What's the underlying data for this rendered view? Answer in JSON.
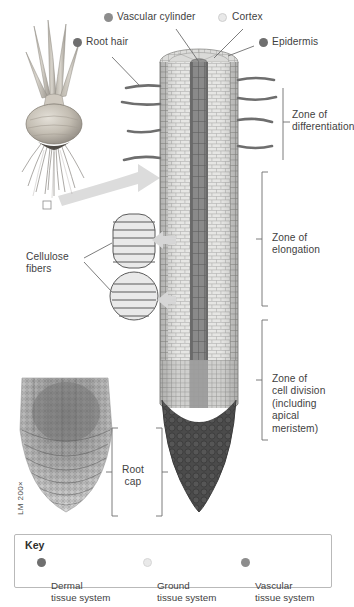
{
  "figure": {
    "title_labels": {
      "vascular_cylinder": "Vascular cylinder",
      "cortex": "Cortex",
      "epidermis": "Epidermis",
      "root_hair": "Root hair"
    },
    "side_labels": {
      "cellulose_fibers": "Cellulose\nfibers",
      "root_cap": "Root\ncap",
      "micrograph_scale": "LM 200×"
    },
    "zones": [
      {
        "id": "differentiation",
        "label": "Zone of\ndifferentiation"
      },
      {
        "id": "elongation",
        "label": "Zone of\nelongation"
      },
      {
        "id": "cell_division",
        "label": "Zone of\ncell division\n(including\napical\nmeristem)"
      }
    ]
  },
  "key": {
    "title": "Key",
    "items": [
      {
        "label": "Dermal\ntissue system",
        "color": "#6f6f6f"
      },
      {
        "label": "Ground\ntissue system",
        "color": "#e9e9e9"
      },
      {
        "label": "Vascular\ntissue system",
        "color": "#8d8d8d"
      }
    ]
  },
  "colors": {
    "dermal": "#6f6f6f",
    "ground": "#e9e9e9",
    "vascular": "#8d8d8d",
    "root_cap": "#4f4f4f",
    "cortex_fill": "#e3e3e1",
    "leader": "#6e6e6e",
    "arrow": "#dcdcdc",
    "text": "#3f3f3f"
  }
}
